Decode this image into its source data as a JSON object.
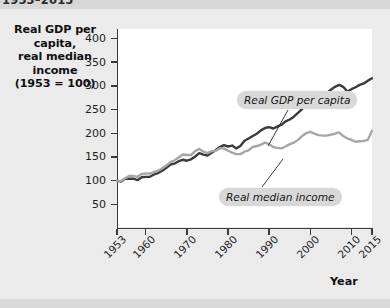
{
  "figure": {
    "top_title": "1953–2015",
    "y_axis_title_line1": "Real GDP per capita,",
    "y_axis_title_line2": "real median income",
    "y_axis_title_line3": "(1953 = 100)",
    "x_axis_title": "Year"
  },
  "chart_data": {
    "type": "line",
    "title": "1953–2015",
    "xlabel": "Year",
    "ylabel": "Real GDP per capita, real median income (1953 = 100)",
    "xlim": [
      1953,
      2015
    ],
    "ylim": [
      0,
      420
    ],
    "yticks": [
      50,
      100,
      150,
      200,
      250,
      300,
      350,
      400
    ],
    "xticks": [
      1953,
      1960,
      1970,
      1980,
      1990,
      2000,
      2010,
      2015
    ],
    "xtick_labels": [
      "1953",
      "1960",
      "1970",
      "1980",
      "1990",
      "2000",
      "2010",
      "2015"
    ],
    "ytick_labels": [
      "50",
      "100",
      "150",
      "200",
      "250",
      "300",
      "350",
      "400"
    ],
    "grid": false,
    "legend": "annotations",
    "annotations": [
      {
        "text": "Real GDP per capita",
        "series": "Real GDP per capita"
      },
      {
        "text": "Real median income",
        "series": "Real median income"
      }
    ],
    "x": [
      1953,
      1954,
      1955,
      1956,
      1957,
      1958,
      1959,
      1960,
      1961,
      1962,
      1963,
      1964,
      1965,
      1966,
      1967,
      1968,
      1969,
      1970,
      1971,
      1972,
      1973,
      1974,
      1975,
      1976,
      1977,
      1978,
      1979,
      1980,
      1981,
      1982,
      1983,
      1984,
      1985,
      1986,
      1987,
      1988,
      1989,
      1990,
      1991,
      1992,
      1993,
      1994,
      1995,
      1996,
      1997,
      1998,
      1999,
      2000,
      2001,
      2002,
      2003,
      2004,
      2005,
      2006,
      2007,
      2008,
      2009,
      2010,
      2011,
      2012,
      2013,
      2014,
      2015
    ],
    "series": [
      {
        "name": "Real GDP per capita",
        "color": "#3b3b3b",
        "values": [
          100,
          98,
          104,
          104,
          104,
          101,
          107,
          108,
          108,
          113,
          116,
          121,
          127,
          134,
          136,
          141,
          144,
          142,
          145,
          151,
          158,
          155,
          153,
          159,
          164,
          171,
          175,
          172,
          174,
          168,
          173,
          184,
          189,
          194,
          199,
          206,
          211,
          213,
          210,
          214,
          218,
          225,
          229,
          235,
          243,
          251,
          261,
          269,
          268,
          270,
          276,
          284,
          292,
          298,
          302,
          298,
          288,
          293,
          297,
          302,
          305,
          311,
          316
        ]
      },
      {
        "name": "Real median income",
        "color": "#a6a6a6",
        "values": [
          100,
          99,
          105,
          110,
          110,
          108,
          114,
          115,
          115,
          118,
          121,
          126,
          132,
          139,
          143,
          149,
          155,
          154,
          154,
          162,
          167,
          161,
          158,
          162,
          163,
          168,
          168,
          163,
          159,
          156,
          156,
          161,
          164,
          171,
          173,
          176,
          180,
          177,
          171,
          169,
          168,
          172,
          177,
          180,
          186,
          194,
          200,
          203,
          199,
          196,
          195,
          195,
          197,
          199,
          202,
          194,
          189,
          186,
          182,
          183,
          184,
          186,
          205
        ]
      }
    ]
  }
}
